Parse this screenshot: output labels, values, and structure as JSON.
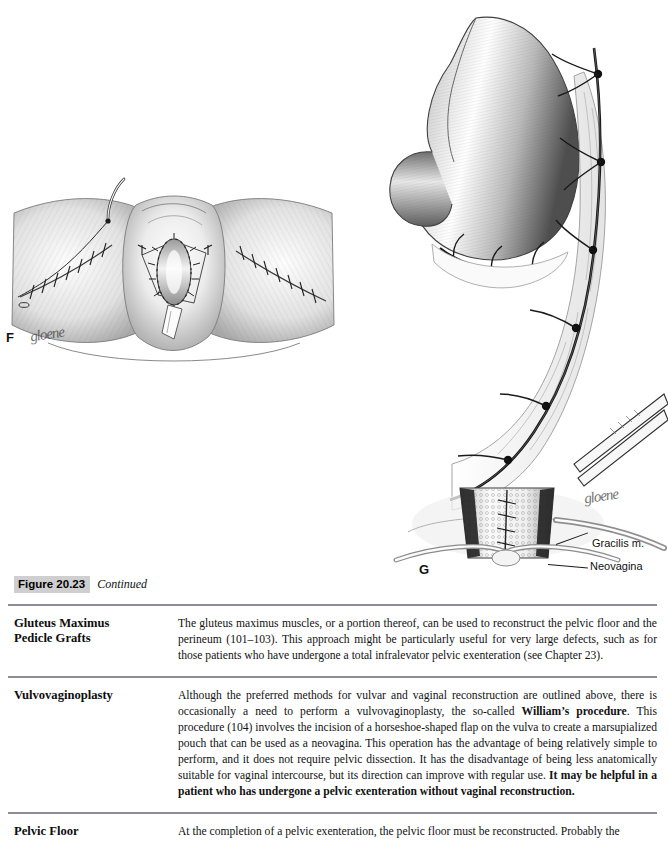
{
  "figure": {
    "caption_number": "Figure 20.23",
    "caption_continued": "Continued",
    "panels": [
      {
        "letter": "F",
        "name": "perineal-closure-panel",
        "description": "Perineal reconstruction with sutured skin flaps and neovaginal introitus",
        "signature": "gloene"
      },
      {
        "letter": "G",
        "name": "bowel-pedicle-panel",
        "description": "Bowel segment on vascular pedicle mobilized to the pelvis to form a neovagina",
        "signature": "gloene"
      }
    ],
    "labels": [
      {
        "text": "Gracilis m."
      },
      {
        "text": "Neovagina"
      }
    ]
  },
  "sections": [
    {
      "heading": "Gluteus Maximus Pedicle Grafts",
      "heading_line1": "Gluteus Maximus",
      "heading_line2": "Pedicle Grafts",
      "body_html": "The gluteus maximus muscles, or a portion thereof, can be used to reconstruct the pelvic floor and the perineum (101–103). This approach might be particularly useful for very large defects, such as for those patients who have undergone a total infralevator pelvic exenteration (see Chapter 23)."
    },
    {
      "heading": "Vulvovaginoplasty",
      "heading_line1": "Vulvovaginoplasty",
      "heading_line2": "",
      "body_html": "Although the preferred methods for vulvar and vaginal reconstruction are outlined above, there is occasionally a need to perform a vulvovaginoplasty, the so-called <b>William’s procedure</b>. This procedure (104) involves the incision of a horseshoe-shaped flap on the vulva to create a marsupialized pouch that can be used as a neovagina. This operation has the advantage of being relatively simple to perform, and it does not require pelvic dissection. It has the disadvantage of being less anatomically suitable for vaginal intercourse, but its direction can improve with regular use. <b>It may be helpful in a patient who has undergone a pelvic exenteration without vaginal reconstruction.</b>"
    },
    {
      "heading": "Pelvic Floor",
      "heading_line1": "Pelvic Floor",
      "heading_line2": "",
      "body_html": "At the completion of a pelvic exenteration, the pelvic floor must be reconstructed. Probably the"
    }
  ],
  "colors": {
    "rule": "#8e8e96",
    "caption_box": "#cfcfcf",
    "text": "#111111",
    "ink": "#1a1a1a"
  }
}
